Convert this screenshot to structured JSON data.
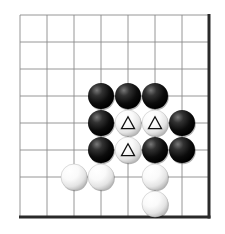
{
  "board": {
    "type": "go-board",
    "label": "Go board diagram",
    "grid": {
      "columns": 8,
      "rows": 7,
      "origin_x": 20,
      "origin_y": 15,
      "spacing": 27,
      "line_color": "#8a8a8a",
      "edge_color": "#2a2a2a",
      "edge_right_x": 209,
      "edge_bottom_y": 217,
      "background_color": "#ffffff"
    },
    "colors": {
      "black_stone": "#111111",
      "white_stone": "#fafafa",
      "mark_on_white": "#111111"
    },
    "stones": [
      {
        "id": "b1",
        "color": "black",
        "col": 3,
        "row": 3,
        "mark": ""
      },
      {
        "id": "b2",
        "color": "black",
        "col": 4,
        "row": 3,
        "mark": ""
      },
      {
        "id": "b3",
        "color": "black",
        "col": 5,
        "row": 3,
        "mark": ""
      },
      {
        "id": "b4",
        "color": "black",
        "col": 3,
        "row": 4,
        "mark": ""
      },
      {
        "id": "w1",
        "color": "white",
        "col": 4,
        "row": 4,
        "mark": "triangle"
      },
      {
        "id": "w2",
        "color": "white",
        "col": 5,
        "row": 4,
        "mark": "triangle"
      },
      {
        "id": "b5",
        "color": "black",
        "col": 6,
        "row": 4,
        "mark": ""
      },
      {
        "id": "b6",
        "color": "black",
        "col": 3,
        "row": 5,
        "mark": ""
      },
      {
        "id": "w3",
        "color": "white",
        "col": 4,
        "row": 5,
        "mark": "triangle"
      },
      {
        "id": "b7",
        "color": "black",
        "col": 5,
        "row": 5,
        "mark": ""
      },
      {
        "id": "b8",
        "color": "black",
        "col": 6,
        "row": 5,
        "mark": ""
      },
      {
        "id": "w4",
        "color": "white",
        "col": 2,
        "row": 6,
        "mark": ""
      },
      {
        "id": "w5",
        "color": "white",
        "col": 3,
        "row": 6,
        "mark": ""
      },
      {
        "id": "w6",
        "color": "white",
        "col": 5,
        "row": 6,
        "mark": ""
      },
      {
        "id": "w7",
        "color": "white",
        "col": 5,
        "row": 7,
        "mark": ""
      }
    ],
    "stone_diameter": 26,
    "mark_size": 13
  }
}
